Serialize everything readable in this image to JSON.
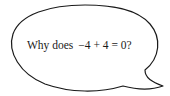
{
  "speech_bubble": {
    "prefix": "Why does",
    "expression": "−4 + 4 = 0?",
    "tail_direction": "bottom-right",
    "stroke_color": "#1a1a1a",
    "fill_color": "#ffffff"
  }
}
